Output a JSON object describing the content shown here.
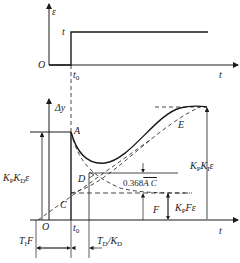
{
  "top_chart": {
    "y_axis_label": "ε",
    "origin_label": "O",
    "step_level_label": "t",
    "step_time_label": "t",
    "step_time_sub": "0",
    "x_axis_label": "t"
  },
  "bottom_chart": {
    "y_axis_label": "Δy",
    "origin_label": "O",
    "step_time_label": "t",
    "step_time_sub": "0",
    "x_axis_label": "t",
    "points": {
      "A": "A",
      "C": "C",
      "D": "D",
      "E": "E",
      "F": "F"
    },
    "annotations": {
      "kp_kd_eps": {
        "k1": "K",
        "s1": "P",
        "k2": "K",
        "s2": "D",
        "tail": "ε"
      },
      "kp_ki_eps": {
        "k1": "K",
        "s1": "P",
        "k2": "K",
        "s2": "I",
        "tail": "ε"
      },
      "kp_f_eps": {
        "k1": "K",
        "s1": "P",
        "tail": "Fε"
      },
      "ratio": {
        "prefix": "0.368",
        "overline": "A C"
      },
      "ti_f": {
        "t": "T",
        "sub": "I",
        "tail": "F"
      },
      "td_kd": {
        "t": "T",
        "sub": "D",
        "mid": "/K",
        "sub2": "D"
      }
    }
  },
  "colors": {
    "line": "#1a1a1a",
    "background": "#ffffff"
  }
}
